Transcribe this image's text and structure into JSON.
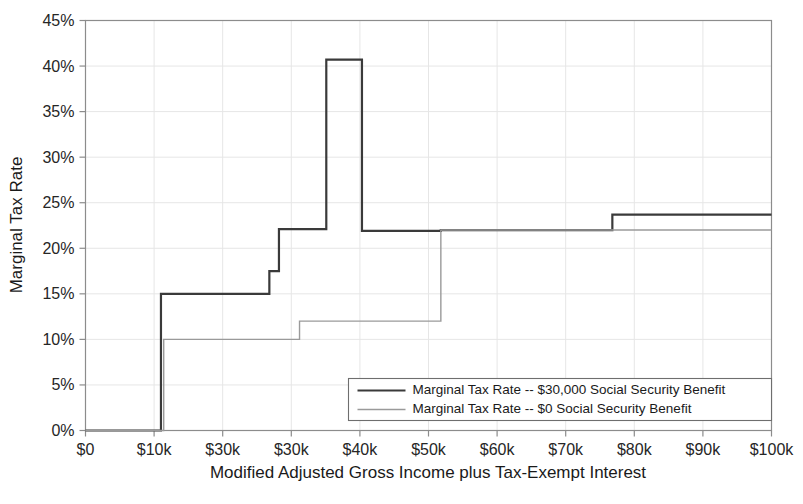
{
  "chart_data": {
    "type": "line",
    "title": "",
    "subtitle": "",
    "xlabel": "Modified Adjusted Gross Income plus Tax-Exempt Interest",
    "ylabel": "Marginal Tax Rate",
    "xlim": [
      0,
      100000
    ],
    "ylim": [
      0,
      45
    ],
    "grid": true,
    "legend_position": "bottom-right",
    "x_tick_values": [
      0,
      10000,
      20000,
      30000,
      40000,
      50000,
      60000,
      70000,
      80000,
      90000,
      100000
    ],
    "x_tick_labels": [
      "$0",
      "$10k",
      "$30k",
      "$30k",
      "$40k",
      "$50k",
      "$60k",
      "$70k",
      "$80k",
      "$90k",
      "$100k"
    ],
    "y_tick_values": [
      0,
      5,
      10,
      15,
      20,
      25,
      30,
      35,
      40,
      45
    ],
    "y_tick_labels": [
      "0%",
      "5%",
      "10%",
      "15%",
      "20%",
      "25%",
      "30%",
      "35%",
      "40%",
      "45%"
    ],
    "series": [
      {
        "name": "Marginal Tax Rate -- $30,000 Social Security Benefit",
        "color": "#3a3a3a",
        "width": 2.2,
        "step": "post",
        "points": [
          {
            "x": 0,
            "y": 0
          },
          {
            "x": 11000,
            "y": 0
          },
          {
            "x": 11000,
            "y": 15.0
          },
          {
            "x": 26800,
            "y": 15.0
          },
          {
            "x": 26800,
            "y": 17.5
          },
          {
            "x": 28200,
            "y": 17.5
          },
          {
            "x": 28200,
            "y": 22.1
          },
          {
            "x": 35100,
            "y": 22.1
          },
          {
            "x": 35100,
            "y": 40.7
          },
          {
            "x": 40300,
            "y": 40.7
          },
          {
            "x": 40300,
            "y": 21.9
          },
          {
            "x": 51800,
            "y": 21.9
          },
          {
            "x": 51800,
            "y": 22.0
          },
          {
            "x": 76800,
            "y": 22.0
          },
          {
            "x": 76800,
            "y": 23.7
          },
          {
            "x": 100000,
            "y": 23.7
          }
        ]
      },
      {
        "name": "Marginal Tax Rate -- $0 Social Security Benefit",
        "color": "#9a9a9a",
        "width": 1.4,
        "step": "post",
        "points": [
          {
            "x": 0,
            "y": 0
          },
          {
            "x": 11400,
            "y": 0
          },
          {
            "x": 11400,
            "y": 10.0
          },
          {
            "x": 31200,
            "y": 10.0
          },
          {
            "x": 31200,
            "y": 12.0
          },
          {
            "x": 51800,
            "y": 12.0
          },
          {
            "x": 51800,
            "y": 22.0
          },
          {
            "x": 100000,
            "y": 22.0
          }
        ]
      }
    ]
  },
  "legend": {
    "entries": [
      {
        "label": "Marginal Tax Rate -- $30,000 Social Security Benefit",
        "color": "#3a3a3a"
      },
      {
        "label": "Marginal Tax Rate -- $0 Social Security Benefit",
        "color": "#9a9a9a"
      }
    ]
  }
}
